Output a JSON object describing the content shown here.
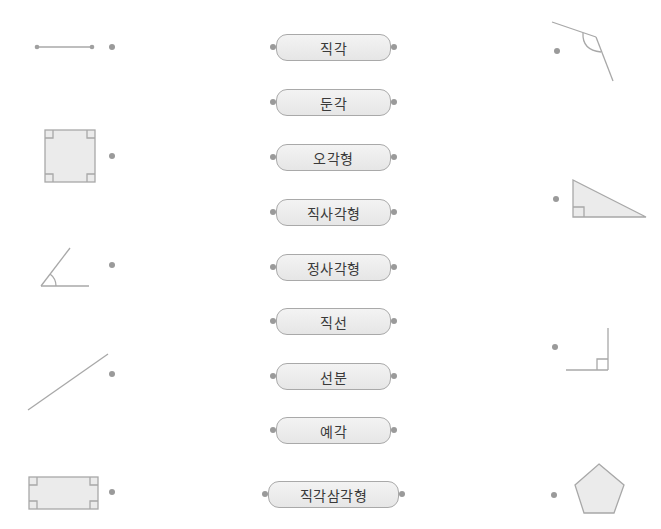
{
  "exercise": {
    "left_figures": [
      {
        "id": "line-segment",
        "shape": "line-segment"
      },
      {
        "id": "square",
        "shape": "square"
      },
      {
        "id": "acute-angle",
        "shape": "acute-angle"
      },
      {
        "id": "straight-line",
        "shape": "straight-line"
      },
      {
        "id": "rectangle",
        "shape": "rectangle"
      }
    ],
    "terms": [
      {
        "label": "직각"
      },
      {
        "label": "둔각"
      },
      {
        "label": "오각형"
      },
      {
        "label": "직사각형"
      },
      {
        "label": "정사각형"
      },
      {
        "label": "직선"
      },
      {
        "label": "선분"
      },
      {
        "label": "예각"
      },
      {
        "label": "직각삼각형"
      }
    ],
    "right_figures": [
      {
        "id": "obtuse-angle",
        "shape": "obtuse-angle"
      },
      {
        "id": "right-triangle",
        "shape": "right-triangle"
      },
      {
        "id": "right-angle",
        "shape": "right-angle"
      },
      {
        "id": "pentagon",
        "shape": "pentagon"
      }
    ]
  },
  "colors": {
    "stroke": "#a8a8a8",
    "fill": "#ebebeb",
    "dot": "#9a9a9a",
    "pill_border": "#a9a9a9",
    "text": "#3a3a3a"
  }
}
